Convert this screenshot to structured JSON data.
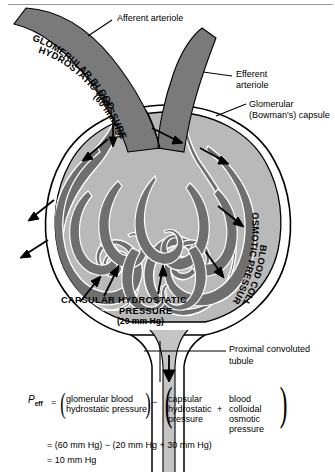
{
  "figure": {
    "colors": {
      "blood_vessel": "#7a7a7a",
      "capsular_space": "#b9b9b9",
      "capsule_outline": "#000000",
      "tubule_fill": "#c4c4c4",
      "background": "#ffffff",
      "arrow": "#000000",
      "rule": "#9a9a9a"
    }
  },
  "callouts": {
    "afferent_arteriole": "Afferent arteriole",
    "efferent_arteriole_line1": "Efferent",
    "efferent_arteriole_line2": "arteriole",
    "glomerular_capsule_line1": "Glomerular",
    "glomerular_capsule_line2": "(Bowman's)  capsule",
    "proximal_tubule_line1": "Proximal convoluted",
    "proximal_tubule_line2": "tubule"
  },
  "pressure_labels": {
    "glomerular_blood": {
      "line1": "GLOMERULAR BLOOD",
      "line2": "HYDROSTATIC PRESSURE",
      "line3": "(60 mm Hg)",
      "value": "60 mm Hg"
    },
    "blood_colloidal": {
      "line1": "BLOOD COLLOIDAL",
      "line2": "OSMOTIC PRESSURE (30 mm Hg)",
      "value": "30 mm Hg"
    },
    "capsular_hydrostatic": {
      "line1": "CAPSULAR  HYDROSTATIC",
      "line2": "PRESSURE",
      "line3": "(20 mm Hg)",
      "value": "20 mm Hg"
    }
  },
  "equation": {
    "symbol": "P",
    "subscript": "eff",
    "equals": "=",
    "minus": "−",
    "plus": "+",
    "term1_line1": "glomerular blood",
    "term1_line2": "hydrostatic pressure",
    "term2a_line1": "capsular",
    "term2a_line2": "hydrostatic",
    "term2a_line3": "pressure",
    "term2b_line1": "blood",
    "term2b_line2": "colloidal",
    "term2b_line3": "osmotic",
    "term2b_line4": "pressure",
    "result_line1": "=  (60 mm Hg)  −  (20 mm Hg  +  30 mm Hg)",
    "result_line2": "=  10 mm Hg"
  }
}
